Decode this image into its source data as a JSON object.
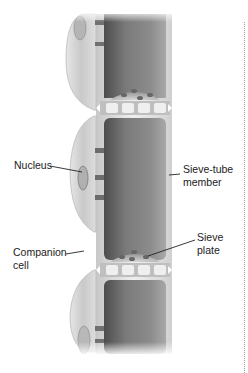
{
  "figure": {
    "type": "diagram",
    "labels": {
      "nucleus": "Nucleus",
      "sieve_tube_member_line1": "Sieve-tube",
      "sieve_tube_member_line2": "member",
      "companion_cell_line1": "Companion",
      "companion_cell_line2": "cell",
      "sieve_plate_line1": "Sieve",
      "sieve_plate_line2": "plate"
    },
    "colors": {
      "tube_dark": "#6e6e6e",
      "tube_mid": "#9a9a9a",
      "wall_light": "#dcdcdc",
      "companion_cell": "#cfcfcf",
      "leader_line": "#222222",
      "text": "#222222"
    }
  }
}
